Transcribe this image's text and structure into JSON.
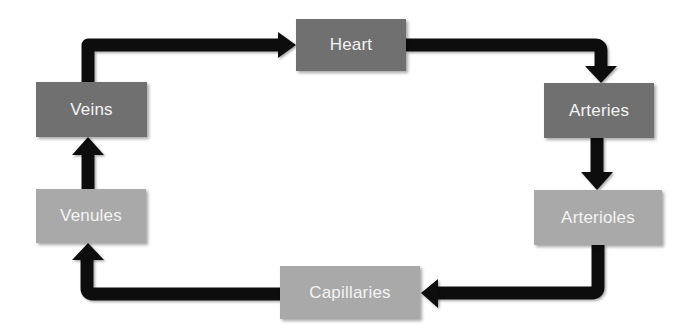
{
  "diagram": {
    "type": "cycle",
    "title": "",
    "colors": {
      "dark_node": "#707070",
      "light_node": "#a9a9a9",
      "arrow": "#111111",
      "label": "#f4f4f4",
      "background": "#ffffff"
    },
    "nodes": [
      {
        "id": "heart",
        "label": "Heart",
        "shade": "dark"
      },
      {
        "id": "arteries",
        "label": "Arteries",
        "shade": "dark"
      },
      {
        "id": "arterioles",
        "label": "Arterioles",
        "shade": "light"
      },
      {
        "id": "capillaries",
        "label": "Capillaries",
        "shade": "light"
      },
      {
        "id": "venules",
        "label": "Venules",
        "shade": "light"
      },
      {
        "id": "veins",
        "label": "Veins",
        "shade": "dark"
      }
    ],
    "edges": [
      {
        "from": "heart",
        "to": "arteries"
      },
      {
        "from": "arteries",
        "to": "arterioles"
      },
      {
        "from": "arterioles",
        "to": "capillaries"
      },
      {
        "from": "capillaries",
        "to": "venules"
      },
      {
        "from": "venules",
        "to": "veins"
      },
      {
        "from": "veins",
        "to": "heart"
      }
    ]
  }
}
